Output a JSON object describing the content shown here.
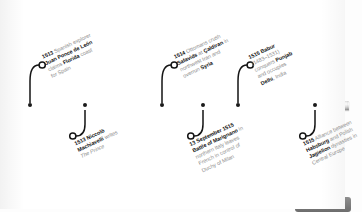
{
  "diagram": {
    "type": "timeline",
    "orientation": "horizontal",
    "bar_label": "timeline-axis",
    "page_number": "156",
    "entries": [
      {
        "id": "ponce-de-leon",
        "side": "above",
        "year": "1513",
        "lines": [
          [
            {
              "t": "1513",
              "b": true
            },
            {
              "t": " Spanish explorer",
              "b": false
            }
          ],
          [
            {
              "t": "Juan Ponce de León",
              "b": true
            }
          ],
          [
            {
              "t": "claims ",
              "b": false
            },
            {
              "t": "Florida",
              "b": true
            },
            {
              "t": " coast",
              "b": false
            }
          ],
          [
            {
              "t": "for Spain",
              "b": false
            }
          ]
        ],
        "node_x": 30
      },
      {
        "id": "machiavelli-prince",
        "side": "below",
        "year": "1513",
        "lines": [
          [
            {
              "t": "1513",
              "b": true
            },
            {
              "t": " Niccolò",
              "b": true
            }
          ],
          [
            {
              "t": "Machiavelli",
              "b": true
            },
            {
              "t": " writes",
              "b": false
            }
          ],
          [
            {
              "t": "The Prince",
              "b": false,
              "i": true
            }
          ]
        ],
        "node_x": 85
      },
      {
        "id": "ottomans-caldiran",
        "side": "above",
        "year": "1514",
        "lines": [
          [
            {
              "t": "1514",
              "b": true
            },
            {
              "t": " Ottomans crush",
              "b": false
            }
          ],
          [
            {
              "t": "Safavids",
              "b": true
            },
            {
              "t": " at ",
              "b": false
            },
            {
              "t": "Çaldiran",
              "b": true
            },
            {
              "t": " in",
              "b": false
            }
          ],
          [
            {
              "t": "northwest Iran and",
              "b": false
            }
          ],
          [
            {
              "t": "overrun ",
              "b": false
            },
            {
              "t": "Syria",
              "b": true
            }
          ]
        ],
        "node_x": 162
      },
      {
        "id": "battle-of-marignano",
        "side": "below",
        "year": "13 September 1515",
        "lines": [
          [
            {
              "t": "13 September 1515",
              "b": true
            }
          ],
          [
            {
              "t": "Battle of Marignano",
              "b": true
            },
            {
              "t": " in",
              "b": false
            }
          ],
          [
            {
              "t": "northern Italy leaves",
              "b": false
            }
          ],
          [
            {
              "t": "French in control of",
              "b": false
            }
          ],
          [
            {
              "t": "Duchy of Milan",
              "b": false
            }
          ]
        ],
        "node_x": 203
      },
      {
        "id": "babur-delhi",
        "side": "above",
        "year": "1515",
        "lines": [
          [
            {
              "t": "1515",
              "b": true
            },
            {
              "t": " Babur",
              "b": true
            }
          ],
          [
            {
              "t": "(1483–1531)",
              "b": false
            }
          ],
          [
            {
              "t": "conquers ",
              "b": false
            },
            {
              "t": "Punjab",
              "b": true
            }
          ],
          [
            {
              "t": "and occupies",
              "b": false
            }
          ],
          [
            {
              "t": "Delhi",
              "b": true
            },
            {
              "t": ", India",
              "b": false
            }
          ]
        ],
        "node_x": 238
      },
      {
        "id": "habsburg-jagiellon-alliance",
        "side": "below",
        "year": "1515",
        "lines": [
          [
            {
              "t": "1515",
              "b": true
            },
            {
              "t": " Alliance between",
              "b": false
            }
          ],
          [
            {
              "t": "Habsburg",
              "b": true
            },
            {
              "t": " and Polish",
              "b": false
            }
          ],
          [
            {
              "t": "Jagiellon",
              "b": true
            },
            {
              "t": " dynasties in",
              "b": false
            }
          ],
          [
            {
              "t": "Central Europe",
              "b": false
            }
          ]
        ],
        "node_x": 315
      }
    ]
  }
}
